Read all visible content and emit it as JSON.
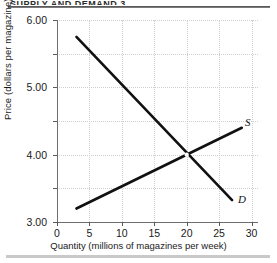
{
  "figure": {
    "heading_sliver": "SUPPLY AND DEMAND 3",
    "top_rule_name": "top-rule",
    "bottom_rule_name": "bottom-rule"
  },
  "chart_data": {
    "type": "line",
    "title": "",
    "xlabel": "Quantity (millions of magazines per week)",
    "ylabel": "Price (dollars per magazine)",
    "xlim": [
      0,
      31
    ],
    "ylim": [
      0,
      6.0
    ],
    "grid": true,
    "legend_position": "inline-end-labels",
    "xticks": [
      0,
      5,
      10,
      15,
      20,
      25,
      30
    ],
    "xtick_labels": [
      "0",
      "5",
      "10",
      "15",
      "20",
      "25",
      "30"
    ],
    "yticks": [
      0,
      1.0,
      2.0,
      3.0,
      4.0,
      5.0,
      6.0
    ],
    "ytick_labels": [
      "0",
      "1.00",
      "2.00",
      "3.00",
      "4.00",
      "5.00",
      "6.00"
    ],
    "series": [
      {
        "name": "D",
        "label": "D",
        "description": "Demand curve, downward sloping",
        "color": "#111111",
        "x": [
          3,
          27
        ],
        "values": [
          5.5,
          0.65
        ]
      },
      {
        "name": "S",
        "label": "S",
        "description": "Supply curve, upward sloping",
        "color": "#111111",
        "x": [
          3,
          28.5
        ],
        "values": [
          0.4,
          2.8
        ]
      }
    ],
    "annotations": [
      {
        "name": "equilibrium-point",
        "x": 20,
        "y": 2.0,
        "text": ""
      }
    ]
  }
}
